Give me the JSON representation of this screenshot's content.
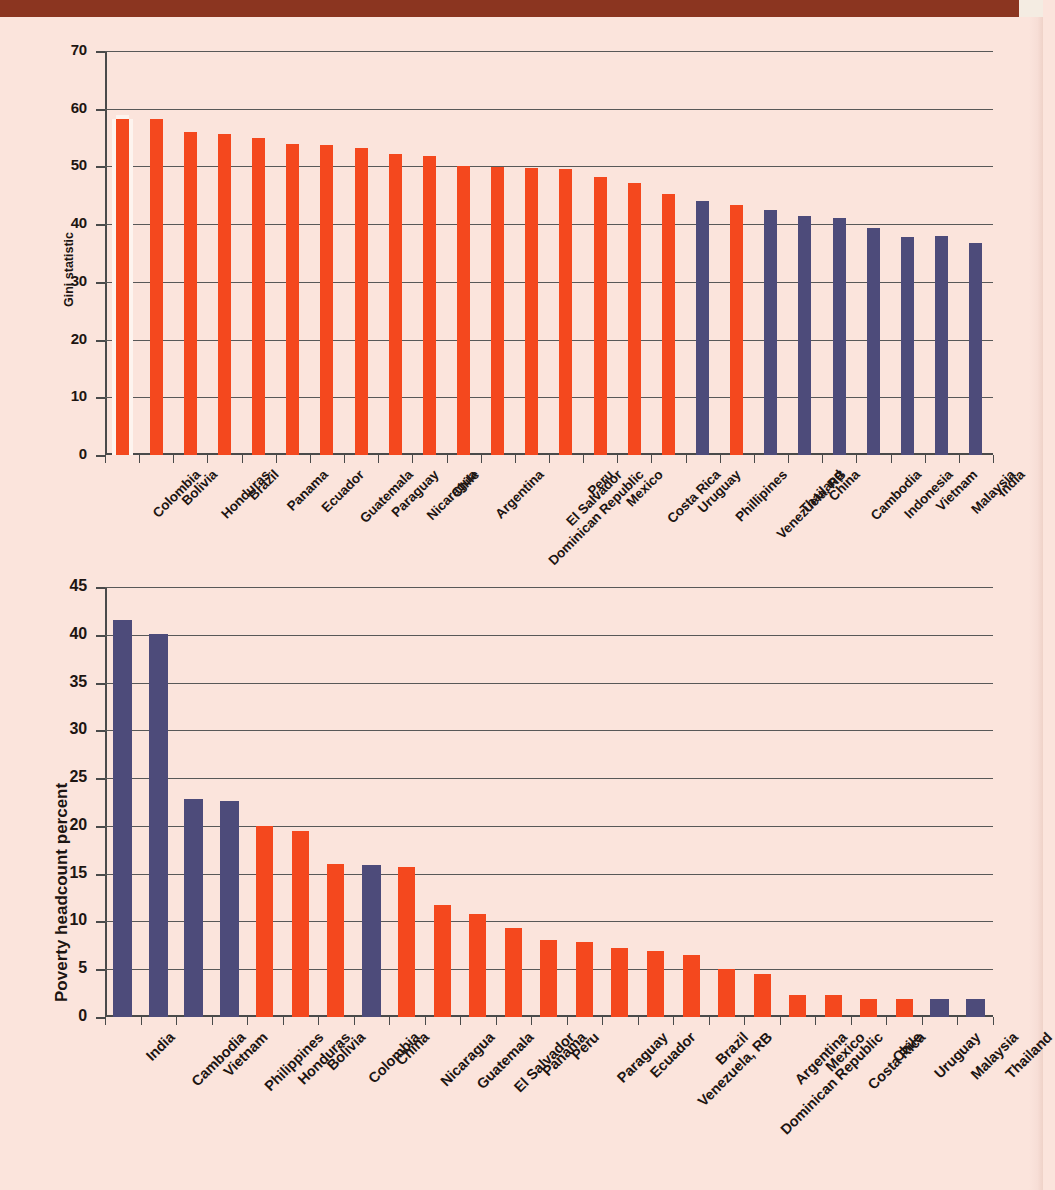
{
  "page": {
    "background_color": "#fbe4dc",
    "band_color": "#8b3520"
  },
  "palette": {
    "latin_america": "#f4481e",
    "asia": "#4d4b7a",
    "gridline": "#585858",
    "axis": "#4a4a4a",
    "highlight_outline": "#fdf4ef"
  },
  "chart_data": [
    {
      "id": "gini",
      "type": "bar",
      "title": "",
      "xlabel": "",
      "ylabel": "Gini statistic",
      "ylim": [
        0,
        70
      ],
      "yticks": [
        0,
        10,
        20,
        30,
        40,
        50,
        60,
        70
      ],
      "grid": true,
      "legend": "none",
      "categories": [
        "Colombia",
        "Bolivia",
        "Honduras",
        "Brazil",
        "Panama",
        "Ecuador",
        "Guatemala",
        "Paraguay",
        "Nicaragua",
        "Chile",
        "Argentina",
        "Dominican Republic",
        "El Salvador",
        "Peru",
        "Mexico",
        "Costa Rica",
        "Uruguay",
        "Phillipines",
        "Venezuela, RB",
        "Thailand",
        "China",
        "Cambodia",
        "Indonesia",
        "Vietnam",
        "Malaysia",
        "India"
      ],
      "values": [
        58.3,
        58.2,
        55.9,
        55.6,
        54.9,
        53.9,
        53.7,
        53.2,
        52.2,
        51.8,
        50.0,
        49.9,
        49.7,
        49.5,
        48.1,
        47.2,
        45.3,
        44.0,
        43.3,
        42.4,
        41.5,
        41.0,
        39.4,
        37.8,
        37.9,
        36.8
      ],
      "group": [
        "latin_america",
        "latin_america",
        "latin_america",
        "latin_america",
        "latin_america",
        "latin_america",
        "latin_america",
        "latin_america",
        "latin_america",
        "latin_america",
        "latin_america",
        "latin_america",
        "latin_america",
        "latin_america",
        "latin_america",
        "latin_america",
        "latin_america",
        "asia",
        "latin_america",
        "asia",
        "asia",
        "asia",
        "asia",
        "asia",
        "asia",
        "asia"
      ],
      "highlight_index": 0
    },
    {
      "id": "poverty",
      "type": "bar",
      "title": "",
      "xlabel": "",
      "ylabel": "Poverty headcount percent",
      "ylim": [
        0,
        45
      ],
      "yticks": [
        0,
        5,
        10,
        15,
        20,
        25,
        30,
        35,
        40,
        45
      ],
      "grid": true,
      "legend": "none",
      "categories": [
        "India",
        "Cambodia",
        "Vietnam",
        "Philippines",
        "Honduras",
        "Bolivia",
        "Colombia",
        "China",
        "Nicaragua",
        "Guatemala",
        "El Salvador",
        "Panama",
        "Peru",
        "Paraguay",
        "Ecuador",
        "Venezuela, RB",
        "Brazil",
        "Dominican Republic",
        "Argentina",
        "Mexico",
        "Costa Rica",
        "Chile",
        "Uruguay",
        "Malaysia",
        "Thailand"
      ],
      "values": [
        41.6,
        40.1,
        22.8,
        22.6,
        20.0,
        19.5,
        16.0,
        15.9,
        15.7,
        11.7,
        10.8,
        9.3,
        8.1,
        7.9,
        7.2,
        6.9,
        6.5,
        5.0,
        4.5,
        2.3,
        2.3,
        1.9,
        1.9,
        1.9,
        1.9
      ],
      "group": [
        "asia",
        "asia",
        "asia",
        "asia",
        "latin_america",
        "latin_america",
        "latin_america",
        "asia",
        "latin_america",
        "latin_america",
        "latin_america",
        "latin_america",
        "latin_america",
        "latin_america",
        "latin_america",
        "latin_america",
        "latin_america",
        "latin_america",
        "latin_america",
        "latin_america",
        "latin_america",
        "latin_america",
        "latin_america",
        "asia",
        "asia"
      ],
      "highlight_index": -1
    }
  ]
}
